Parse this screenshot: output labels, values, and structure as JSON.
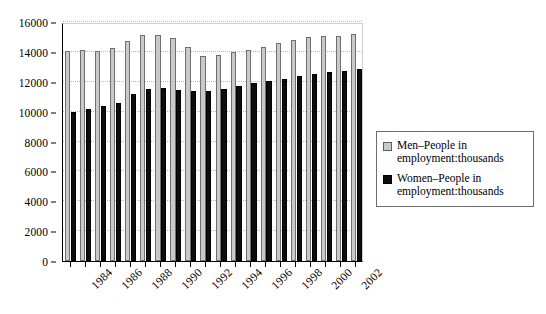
{
  "chart_data": {
    "type": "bar",
    "title": "",
    "subtitle": "",
    "xlabel": "",
    "ylabel": "",
    "ylim": [
      0,
      16000
    ],
    "ytick_step": 2000,
    "yticks": [
      0,
      2000,
      4000,
      6000,
      8000,
      10000,
      12000,
      14000,
      16000
    ],
    "grid": true,
    "legend_position": "right",
    "categories": [
      "1984",
      "1985",
      "1986",
      "1987",
      "1988",
      "1989",
      "1990",
      "1991",
      "1992",
      "1993",
      "1994",
      "1995",
      "1996",
      "1997",
      "1998",
      "1999",
      "2000",
      "2001",
      "2002",
      "2003"
    ],
    "xtick_labels_shown": [
      "1984",
      "1986",
      "1988",
      "1990",
      "1992",
      "1994",
      "1996",
      "1998",
      "2000",
      "2002"
    ],
    "series": [
      {
        "name": "Men–People in employment:thousands",
        "color": "#c9c9c9",
        "values": [
          14050,
          14100,
          14050,
          14250,
          14700,
          15100,
          15100,
          14900,
          14300,
          13700,
          13800,
          14000,
          14100,
          14350,
          14600,
          14800,
          15000,
          15050,
          15050,
          15200
        ]
      },
      {
        "name": "Women–People in employment:thousands",
        "color": "#0d0d0d",
        "values": [
          9950,
          10200,
          10350,
          10550,
          11200,
          11500,
          11550,
          11450,
          11350,
          11400,
          11500,
          11700,
          11900,
          12050,
          12200,
          12400,
          12500,
          12650,
          12700,
          12850
        ]
      }
    ]
  },
  "legend": {
    "entries": [
      {
        "label": "Men–People in employment:thousands",
        "swatch": "men-swatch"
      },
      {
        "label": "Women–People in employment:thousands",
        "swatch": "women-swatch"
      }
    ]
  }
}
